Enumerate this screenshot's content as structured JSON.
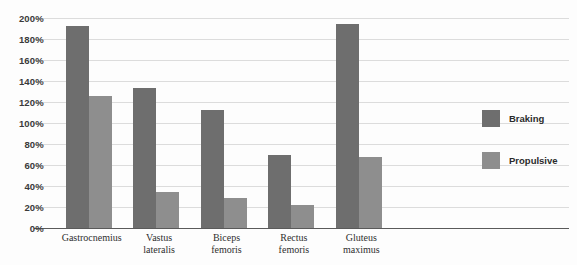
{
  "chart_data": {
    "type": "bar",
    "title": "",
    "xlabel": "",
    "ylabel": "",
    "ylim": [
      0,
      200
    ],
    "ytick_labels": [
      "200%",
      "180%",
      "160%",
      "140%",
      "120%",
      "100%",
      "80%",
      "60%",
      "40%",
      "20%",
      "0%"
    ],
    "ytick_values": [
      200,
      180,
      160,
      140,
      120,
      100,
      80,
      60,
      40,
      20,
      0
    ],
    "grid": true,
    "legend_position": "right",
    "categories": [
      "Gastrocnemius",
      "Vastus lateralis",
      "Biceps femoris",
      "Rectus femoris",
      "Gluteus maximus"
    ],
    "category_lines": [
      [
        "Gastrocnemius"
      ],
      [
        "Vastus",
        "lateralis"
      ],
      [
        "Biceps",
        "femoris"
      ],
      [
        "Rectus",
        "femoris"
      ],
      [
        "Gluteus",
        "maximus"
      ]
    ],
    "series": [
      {
        "name": "Braking",
        "color": "#6e6e6e",
        "values": [
          192,
          133,
          112,
          70,
          194
        ]
      },
      {
        "name": "Propulsive",
        "color": "#8e8e8e",
        "values": [
          126,
          34,
          29,
          22,
          68
        ]
      }
    ]
  },
  "legend": {
    "items": [
      {
        "label": "Braking",
        "color": "#6e6e6e"
      },
      {
        "label": "Propulsive",
        "color": "#8e8e8e"
      }
    ]
  },
  "colors": {
    "braking": "#6e6e6e",
    "propulsive": "#8e8e8e",
    "gridline": "#dcdcdc",
    "axis": "#5a5a5a",
    "background": "#fdfdfd"
  }
}
